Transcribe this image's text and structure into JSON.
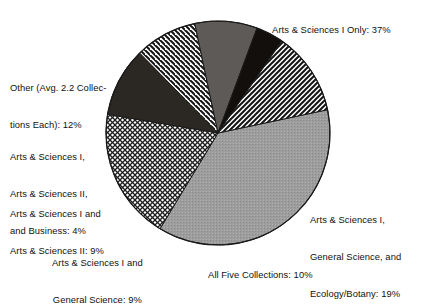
{
  "chart_data": {
    "type": "pie",
    "title": "",
    "subtitle": "",
    "xlabel": "",
    "ylabel": "",
    "legend_position": "none",
    "grid": false,
    "units": "percent",
    "total": 100,
    "categories": [
      "Arts & Sciences I Only",
      "Arts & Sciences I, General Science, and Ecology/Botany",
      "All Five Collections",
      "Arts & Sciences I and General Science",
      "Arts & Sciences I and Arts & Sciences II",
      "Arts & Sciences I, Arts & Sciences II, and Business",
      "Other (Avg. 2.2 Collections Each)"
    ],
    "values": [
      37,
      19,
      10,
      9,
      9,
      4,
      12
    ],
    "slices": [
      {
        "id": "as1-only",
        "label": "Arts & Sciences I Only: 37%",
        "name": "Arts & Sciences I Only",
        "value": 37,
        "fill": "light-gray-stipple",
        "color": "#9a9a9a"
      },
      {
        "id": "as1-gs-eco",
        "label": "Arts & Sciences I, General Science, and Ecology/Botany: 19%",
        "name": "Arts & Sciences I, General Science, and Ecology/Botany",
        "value": 19,
        "fill": "cross-hatch",
        "color": "#ffffff"
      },
      {
        "id": "allfive",
        "label": "All Five Collections: 10%",
        "name": "All Five Collections",
        "value": 10,
        "fill": "solid-dark",
        "color": "#2b2722"
      },
      {
        "id": "as1-gensci",
        "label": "Arts & Sciences I and General Science: 9%",
        "name": "Arts & Sciences I and General Science",
        "value": 9,
        "fill": "diagonal-hatch-down",
        "color": "#ffffff"
      },
      {
        "id": "as1-as2",
        "label": "Arts & Sciences I and Arts & Sciences II: 9%",
        "name": "Arts & Sciences I and Arts & Sciences II",
        "value": 9,
        "fill": "mid-gray",
        "color": "#5e5a57"
      },
      {
        "id": "as1-as2-bus",
        "label": "Arts & Sciences I, Arts & Sciences II, and Business: 4%",
        "name": "Arts & Sciences I, Arts & Sciences II, and Business",
        "value": 4,
        "fill": "solid-black",
        "color": "#120f0d"
      },
      {
        "id": "other",
        "label": "Other (Avg. 2.2 Collections Each): 12%",
        "name": "Other (Avg. 2.2 Collections Each)",
        "value": 12,
        "fill": "diagonal-hatch-up",
        "color": "#ffffff"
      }
    ]
  },
  "labels": {
    "as1_only": "Arts & Sciences I Only: 37%",
    "other_line1": "Other (Avg. 2.2 Collec-",
    "other_line2": "tions Each): 12%",
    "as1_as2_bus_line1": "Arts & Sciences I,",
    "as1_as2_bus_line2": "Arts & Sciences II,",
    "as1_as2_bus_line3": "and Business: 4%",
    "as1_as2_line1": "Arts & Sciences I and",
    "as1_as2_line2": "Arts & Sciences II: 9%",
    "as1_gensci_line1": "Arts & Sciences I and",
    "as1_gensci_line2": "General Science: 9%",
    "allfive": "All Five Collections: 10%",
    "as1_gs_eco_line1": "Arts & Sciences I,",
    "as1_gs_eco_line2": "General Science, and",
    "as1_gs_eco_line3": "Ecology/Botany: 19%"
  },
  "geometry": {
    "center_x": 218,
    "center_y": 133,
    "radius": 112,
    "start_angle_deg": -12
  },
  "colors": {
    "background": "#ffffff",
    "outline": "#1a1a1a",
    "text": "#111111",
    "slice_light_gray": "#9a9a9a",
    "slice_mid_gray": "#5e5a57",
    "slice_dark": "#2b2722",
    "slice_black": "#120f0d"
  }
}
